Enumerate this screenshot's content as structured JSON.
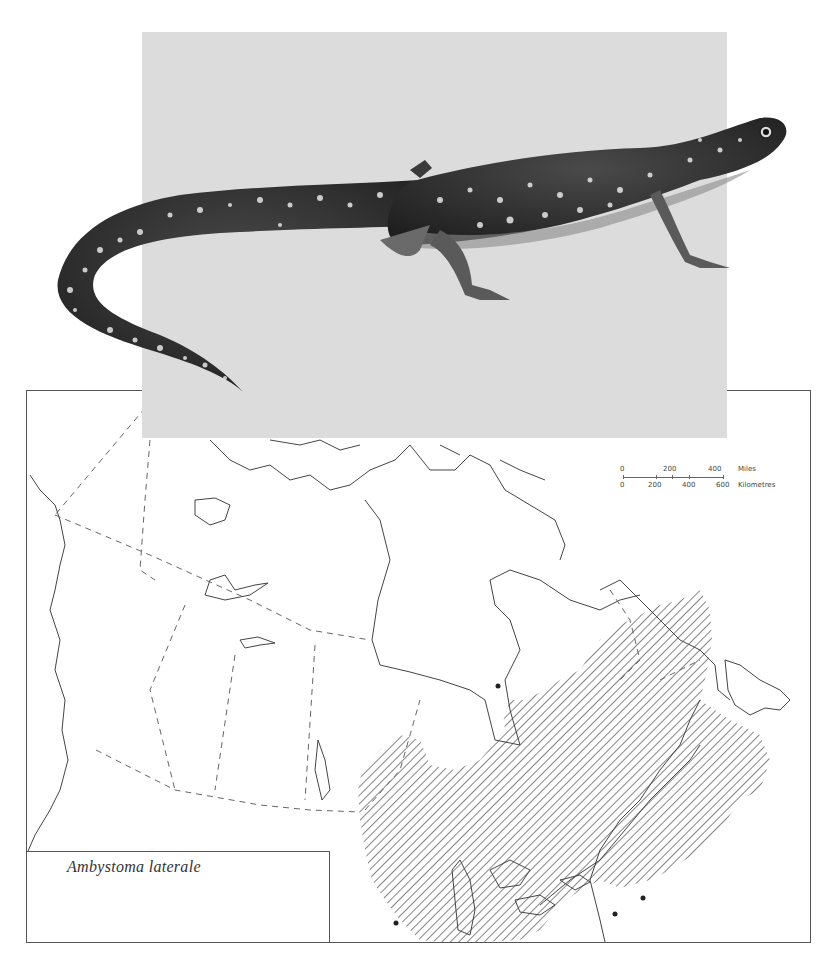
{
  "figure": {
    "species_label": "Ambystoma laterale",
    "illustration": "Blue-spotted salamander, dark body with pale blue-white spots, side view",
    "map_region": "Canada and northern United States",
    "range_pattern": "diagonal hatching",
    "colors": {
      "panel_gray": "#dcdcdc",
      "outline": "#444444",
      "salamander_body": "#3a3a3a",
      "spots": "#e6e6e6"
    }
  },
  "scale_bar": {
    "miles": {
      "ticks": [
        "0",
        "200",
        "400"
      ],
      "unit": "Miles"
    },
    "kilometres": {
      "ticks": [
        "0",
        "200",
        "400",
        "600"
      ],
      "unit": "Kilometres"
    }
  },
  "map_features": {
    "boundaries": "dashed provincial/territorial borders",
    "occurrence_dots": 4
  }
}
